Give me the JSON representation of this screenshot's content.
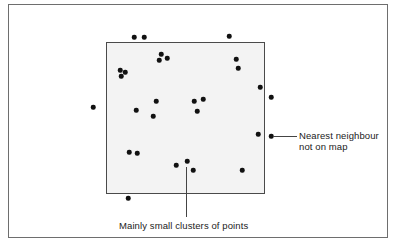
{
  "figure": {
    "frame_color": "#6e6e6e",
    "map_fill": "#f3f3f3",
    "point_color": "#111111"
  },
  "annotations": {
    "nearest_neighbour": {
      "line1": "Nearest neighbour",
      "line2": "not on map"
    },
    "clusters": "Mainly small clusters of points"
  },
  "points": [
    {
      "x": 134,
      "y": 37
    },
    {
      "x": 144,
      "y": 37
    },
    {
      "x": 229,
      "y": 36
    },
    {
      "x": 161,
      "y": 54
    },
    {
      "x": 159,
      "y": 60
    },
    {
      "x": 167,
      "y": 58
    },
    {
      "x": 120,
      "y": 70
    },
    {
      "x": 125,
      "y": 72
    },
    {
      "x": 121,
      "y": 76
    },
    {
      "x": 236,
      "y": 59
    },
    {
      "x": 238,
      "y": 68
    },
    {
      "x": 93,
      "y": 107
    },
    {
      "x": 136,
      "y": 110
    },
    {
      "x": 156,
      "y": 101
    },
    {
      "x": 153,
      "y": 116
    },
    {
      "x": 194,
      "y": 101
    },
    {
      "x": 203,
      "y": 99
    },
    {
      "x": 197,
      "y": 111
    },
    {
      "x": 260,
      "y": 87
    },
    {
      "x": 271,
      "y": 97
    },
    {
      "x": 258,
      "y": 134
    },
    {
      "x": 271,
      "y": 136
    },
    {
      "x": 129,
      "y": 152
    },
    {
      "x": 137,
      "y": 153
    },
    {
      "x": 176,
      "y": 165
    },
    {
      "x": 187,
      "y": 161
    },
    {
      "x": 193,
      "y": 170
    },
    {
      "x": 242,
      "y": 170
    },
    {
      "x": 128,
      "y": 198
    }
  ]
}
